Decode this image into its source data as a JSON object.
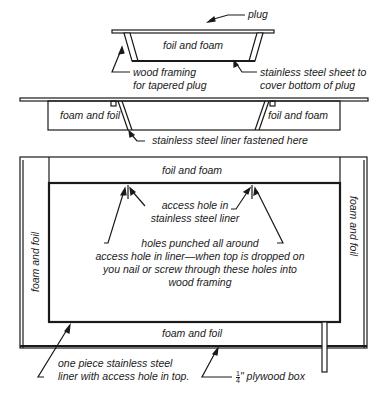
{
  "colors": {
    "ink": "#1a1a1a",
    "background": "#ffffff"
  },
  "top_view": {
    "plug_label": "plug",
    "inner_label": "foil and foam",
    "wood_framing_label_line1": "wood framing",
    "wood_framing_label_line2": "for tapered plug",
    "steel_sheet_label_line1": "stainless steel sheet to",
    "steel_sheet_label_line2": "cover bottom of plug"
  },
  "middle_view": {
    "left_label": "foam and foil",
    "right_label": "foil and foam",
    "fastened_label": "stainless steel liner fastened here"
  },
  "box_view": {
    "top_label": "foil and foam",
    "left_label": "foam and foil",
    "right_label": "foam and foil",
    "bottom_label": "foam and foil",
    "access_hole_line1": "access hole in",
    "access_hole_line2": "stainless steel liner",
    "holes_line1": "holes punched all around",
    "holes_line2": "access hole in liner—when top is dropped on",
    "holes_line3": "you nail or screw through these holes into",
    "holes_line4": "wood framing",
    "liner_line1": "one piece stainless steel",
    "liner_line2": "liner with access hole in top.",
    "plywood_fraction_num": "1",
    "plywood_fraction_den": "4",
    "plywood_label": "\" plywood box"
  }
}
